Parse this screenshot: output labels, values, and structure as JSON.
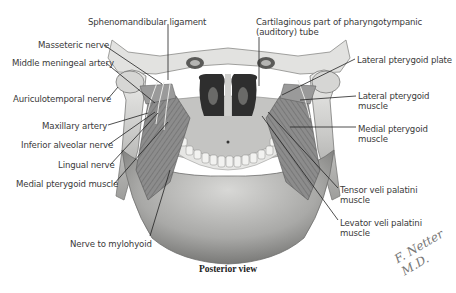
{
  "figure": {
    "caption": "Posterior view",
    "signature": "F. Netter M.D.",
    "colors": {
      "background": "#ffffff",
      "bone_light": "#e4e4e2",
      "bone_mid": "#b8b8b6",
      "bone_dark": "#6e6e6c",
      "muscle": "#8f8f8f",
      "muscle_dark": "#5a5a5a",
      "nasal_cavity": "#2c2c2c",
      "leader_line": "#222222",
      "label_text": "#3a3a3a"
    }
  },
  "labels_left": [
    {
      "text": "Sphenomandibular ligament",
      "x": 88,
      "y": 17,
      "line": [
        [
          168,
          24
        ],
        [
          168,
          80
        ]
      ]
    },
    {
      "text": "Masseteric nerve",
      "x": 38,
      "y": 40,
      "line": [
        [
          104,
          45
        ],
        [
          162,
          84
        ]
      ]
    },
    {
      "text": "Middle meningeal artery",
      "x": 12,
      "y": 58,
      "line": [
        [
          106,
          63
        ],
        [
          155,
          103
        ]
      ]
    },
    {
      "text": "Auriculotemporal nerve",
      "x": 13,
      "y": 94,
      "line": [
        [
          107,
          100
        ],
        [
          118,
          87
        ]
      ]
    },
    {
      "text": "Maxillary artery",
      "x": 42,
      "y": 121,
      "line": [
        [
          108,
          125
        ],
        [
          148,
          113
        ]
      ]
    },
    {
      "text": "Inferior alveolar nerve",
      "x": 21,
      "y": 140,
      "line": [
        [
          108,
          145
        ],
        [
          155,
          112
        ]
      ]
    },
    {
      "text": "Lingual nerve",
      "x": 58,
      "y": 160,
      "line": [
        [
          110,
          165
        ],
        [
          158,
          113
        ]
      ]
    },
    {
      "text": "Medial pterygoid muscle",
      "x": 16,
      "y": 179,
      "line": [
        [
          114,
          184
        ],
        [
          168,
          122
        ]
      ]
    },
    {
      "text": "Nerve to mylohyoid",
      "x": 70,
      "y": 239,
      "line": [
        [
          150,
          236
        ],
        [
          170,
          170
        ]
      ]
    }
  ],
  "labels_right": [
    {
      "text": "Cartilaginous part of pharyngotympanic",
      "text2": "(auditory) tube",
      "x": 256,
      "y": 17,
      "line": [
        [
          259,
          37
        ],
        [
          259,
          86
        ]
      ]
    },
    {
      "text": "Lateral pterygoid plate",
      "x": 357,
      "y": 55,
      "line": [
        [
          355,
          59
        ],
        [
          282,
          95
        ]
      ]
    },
    {
      "text": "Lateral pterygoid",
      "text2": "muscle",
      "x": 358,
      "y": 91,
      "line": [
        [
          356,
          96
        ],
        [
          300,
          100
        ]
      ]
    },
    {
      "text": "Medial pterygoid",
      "text2": "muscle",
      "x": 358,
      "y": 124,
      "line": [
        [
          356,
          127
        ],
        [
          290,
          127
        ]
      ]
    },
    {
      "text": "Tensor veli palatini",
      "text2": "muscle",
      "x": 340,
      "y": 185,
      "line": [
        [
          338,
          188
        ],
        [
          268,
          112
        ]
      ]
    },
    {
      "text": "Levator veli palatini",
      "text2": "muscle",
      "x": 340,
      "y": 218,
      "line": [
        [
          338,
          220
        ],
        [
          262,
          116
        ]
      ]
    }
  ]
}
